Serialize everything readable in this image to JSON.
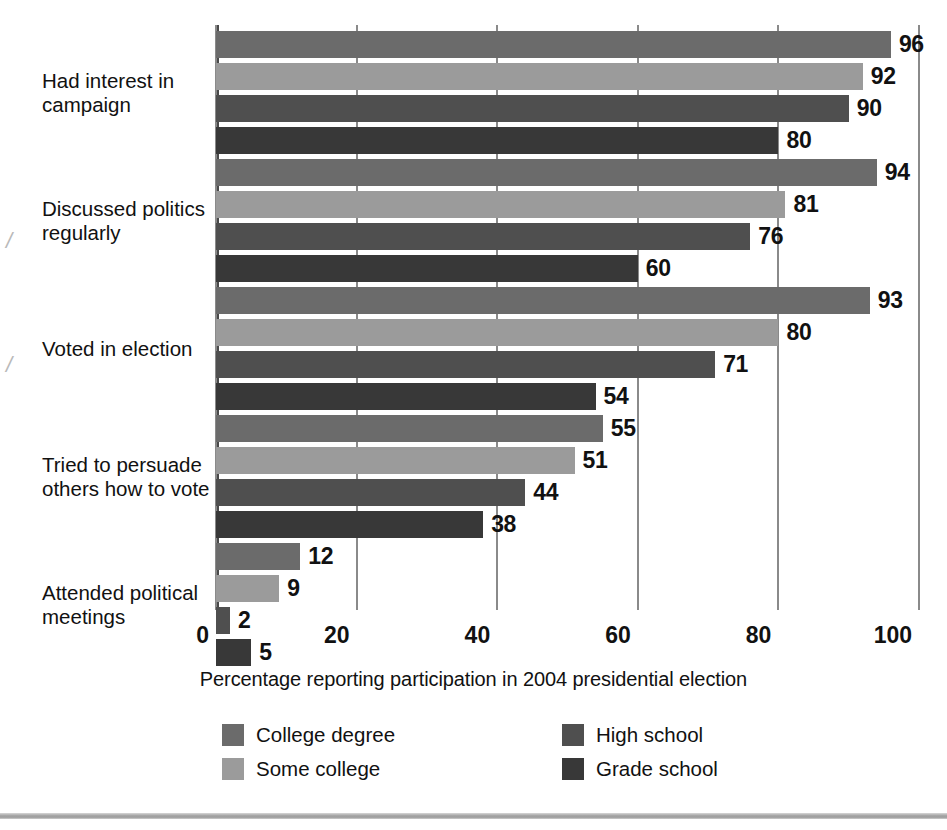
{
  "chart_data": {
    "type": "bar",
    "orientation": "horizontal",
    "title": "",
    "xlabel": "Percentage reporting participation in 2004 presidential election",
    "ylabel": "",
    "xlim": [
      0,
      100
    ],
    "xticks": [
      0,
      20,
      40,
      60,
      80,
      100
    ],
    "xtick_labels": [
      "0",
      "20",
      "40",
      "60",
      "80",
      "100"
    ],
    "grid": "vertical",
    "legend_position": "bottom",
    "categories": [
      "Had interest in campaign",
      "Discussed politics regularly",
      "Voted in election",
      "Tried to persuade others how to vote",
      "Attended political meetings"
    ],
    "category_lines": [
      [
        "Had interest in",
        "campaign"
      ],
      [
        "Discussed politics",
        "regularly"
      ],
      [
        "Voted in election"
      ],
      [
        "Tried to persuade",
        "others how to vote"
      ],
      [
        "Attended political",
        "meetings"
      ]
    ],
    "series": [
      {
        "name": "College degree",
        "color": "#6b6b6b",
        "values": [
          96,
          94,
          93,
          55,
          12
        ]
      },
      {
        "name": "Some college",
        "color": "#9b9b9b",
        "values": [
          92,
          81,
          80,
          51,
          9
        ]
      },
      {
        "name": "High school",
        "color": "#4f4f4f",
        "values": [
          90,
          76,
          71,
          44,
          2
        ]
      },
      {
        "name": "Grade school",
        "color": "#383838",
        "values": [
          80,
          60,
          54,
          38,
          5
        ]
      }
    ]
  },
  "legend": {
    "entries": [
      {
        "label": "College degree",
        "color": "#6b6b6b"
      },
      {
        "label": "High school",
        "color": "#4f4f4f"
      },
      {
        "label": "Some college",
        "color": "#9b9b9b"
      },
      {
        "label": "Grade school",
        "color": "#383838"
      }
    ]
  },
  "axis_title": "Percentage reporting participation in 2004 presidential election",
  "colors": {
    "grid": "#8a8a8a",
    "axis": "#4a4a4a",
    "text": "#111111",
    "rule": "#a8a8a8"
  }
}
